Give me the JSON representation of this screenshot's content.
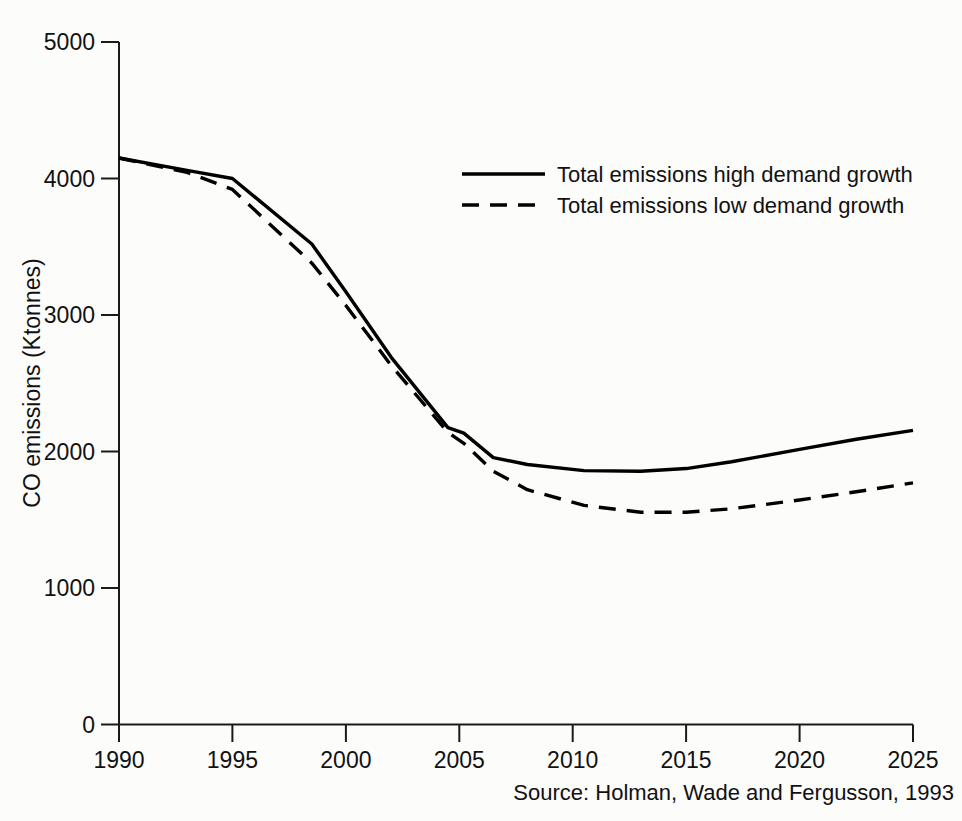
{
  "chart_data": {
    "type": "line",
    "title": "",
    "xlabel": "",
    "ylabel": "CO emissions (Ktonnes)",
    "xlim": [
      1990,
      2025
    ],
    "ylim": [
      0,
      5000
    ],
    "grid": false,
    "legend_position": "upper-center",
    "x_ticks": [
      "1990",
      "1995",
      "2000",
      "2005",
      "2010",
      "2015",
      "2020",
      "2025"
    ],
    "y_ticks": [
      "0",
      "1000",
      "2000",
      "3000",
      "4000",
      "5000"
    ],
    "source": "Source: Holman, Wade and Fergusson, 1993",
    "series": [
      {
        "name": "Total emissions high demand growth",
        "style": "solid",
        "color": "#000000",
        "x": [
          1990,
          1993,
          1995,
          1998.5,
          2000,
          2002,
          2004.5,
          2005.2,
          2006.5,
          2008,
          2010.5,
          2013,
          2015,
          2017,
          2020,
          2022.5,
          2025
        ],
        "values": [
          4150,
          4060,
          4000,
          3520,
          3170,
          2690,
          2175,
          2135,
          1955,
          1905,
          1860,
          1855,
          1875,
          1925,
          2015,
          2090,
          2155
        ]
      },
      {
        "name": "Total emissions low demand growth",
        "style": "dashed",
        "color": "#000000",
        "x": [
          1990,
          1993,
          1995,
          1998.5,
          2000,
          2002,
          2004.5,
          2005.2,
          2006.5,
          2008,
          2010.5,
          2013,
          2015,
          2017,
          2020,
          2022.5,
          2025
        ],
        "values": [
          4150,
          4045,
          3920,
          3380,
          3070,
          2630,
          2140,
          2060,
          1855,
          1720,
          1605,
          1555,
          1555,
          1580,
          1645,
          1705,
          1770
        ]
      }
    ]
  },
  "legend": {
    "items": [
      {
        "label": "Total emissions high demand growth",
        "style": "solid"
      },
      {
        "label": "Total emissions low demand growth",
        "style": "dashed"
      }
    ]
  },
  "axes": {
    "y_title": "CO emissions (Ktonnes)"
  },
  "footer": {
    "source": "Source: Holman, Wade and Fergusson, 1993"
  },
  "colors": {
    "ink": "#000000",
    "background": "#fcfcfb"
  }
}
